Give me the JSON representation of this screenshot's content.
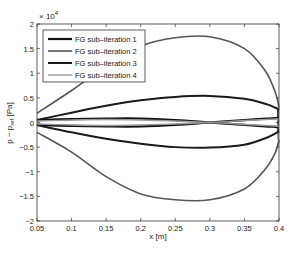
{
  "chart_data": {
    "type": "line",
    "title": "",
    "xlabel": "x [m]",
    "ylabel": "p - p_ref [Pa]",
    "ylabel_main": "p − p",
    "ylabel_sub": "ref",
    "ylabel_unit": " [Pa]",
    "y_exponent_label": "× 10",
    "y_exponent_power": "4",
    "xlim": [
      0.05,
      0.4
    ],
    "ylim": [
      -2,
      2
    ],
    "y_scale_factor": 10000,
    "grid": false,
    "legend_position": "upper left",
    "x_ticks": [
      "0.05",
      "0.1",
      "0.15",
      "0.2",
      "0.25",
      "0.3",
      "0.35",
      "0.4"
    ],
    "y_ticks": [
      "-2",
      "-1.5",
      "-1",
      "-0.5",
      "0",
      "0.5",
      "1",
      "1.5",
      "2"
    ],
    "x": [
      0.05,
      0.1,
      0.15,
      0.2,
      0.25,
      0.3,
      0.35,
      0.38,
      0.395,
      0.4
    ],
    "series": [
      {
        "name": "FG sub-iteration 1",
        "color": "#111111",
        "width": 2.2,
        "upper": [
          0.05,
          0.07,
          0.08,
          0.08,
          0.05,
          0.0,
          -0.05,
          -0.08,
          -0.09,
          -0.1
        ],
        "lower": [
          -0.05,
          -0.07,
          -0.08,
          -0.08,
          -0.05,
          0.0,
          0.05,
          0.08,
          0.09,
          0.1
        ]
      },
      {
        "name": "FG sub-iteration 2",
        "color": "#555555",
        "width": 1.6,
        "upper": [
          0.19,
          0.65,
          1.15,
          1.55,
          1.72,
          1.74,
          1.5,
          1.05,
          0.6,
          0.3
        ],
        "lower": [
          -0.2,
          -0.6,
          -1.1,
          -1.45,
          -1.57,
          -1.57,
          -1.35,
          -0.95,
          -0.6,
          -0.35
        ]
      },
      {
        "name": "FG sub-iteration 3",
        "color": "#1a1a1a",
        "width": 2.0,
        "upper": [
          0.05,
          0.2,
          0.34,
          0.45,
          0.52,
          0.54,
          0.48,
          0.38,
          0.3,
          0.25
        ],
        "lower": [
          -0.05,
          -0.2,
          -0.33,
          -0.43,
          -0.5,
          -0.51,
          -0.45,
          -0.32,
          -0.22,
          -0.18
        ]
      },
      {
        "name": "FG sub-iteration 4",
        "color": "#999999",
        "width": 1.4,
        "upper": [
          0.03,
          0.05,
          0.06,
          0.05,
          0.03,
          0.0,
          -0.04,
          -0.06,
          -0.07,
          -0.08
        ],
        "lower": [
          -0.03,
          -0.05,
          -0.06,
          -0.05,
          -0.03,
          0.0,
          0.04,
          0.06,
          0.07,
          0.08
        ]
      }
    ]
  }
}
